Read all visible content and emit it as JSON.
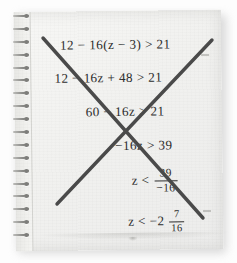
{
  "scene": {
    "description": "Spiral notebook page with handwritten-style algebra work crossed out with a large X",
    "paper_color": "#f3f3f1",
    "ink_color": "#2d2d2d",
    "cross_color": "#4a4a4a",
    "background_color": "#fdfdfd",
    "spiral_ring_count": 18
  },
  "worksheet": {
    "lines": [
      {
        "id": "step-1",
        "text": "12 − 16(z − 3) > 21"
      },
      {
        "id": "step-2",
        "text": "12 − 16z + 48 > 21"
      },
      {
        "id": "step-3",
        "text": "60 − 16z > 21"
      },
      {
        "id": "step-4",
        "text": "−16z > 39"
      },
      {
        "id": "step-5",
        "lead": "z <",
        "fraction": {
          "numerator": "39",
          "denominator": "−16"
        }
      },
      {
        "id": "step-6",
        "lead": "z < −2",
        "fraction": {
          "numerator": "7",
          "denominator": "16"
        }
      }
    ]
  },
  "annotation": {
    "type": "cross-out",
    "strokes": [
      {
        "name": "stroke-descending",
        "x1": 43,
        "y1": 38,
        "x2": 203,
        "y2": 218
      },
      {
        "name": "stroke-ascending",
        "x1": 57,
        "y1": 204,
        "x2": 212,
        "y2": 40
      }
    ]
  }
}
